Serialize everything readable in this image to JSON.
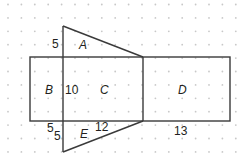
{
  "diagram": {
    "colors": {
      "line": "#3a3a3a",
      "dot": "#c8c8c8",
      "text": "#231f20"
    },
    "regions": [
      {
        "id": "A",
        "label": "A"
      },
      {
        "id": "B",
        "label": "B"
      },
      {
        "id": "C",
        "label": "C"
      },
      {
        "id": "D",
        "label": "D"
      },
      {
        "id": "E",
        "label": "E"
      }
    ],
    "measurements": {
      "a_height": "5",
      "c_height": "10",
      "e_height_1": "5",
      "e_height_2": "5",
      "e_base": "12",
      "d_width": "13"
    }
  }
}
